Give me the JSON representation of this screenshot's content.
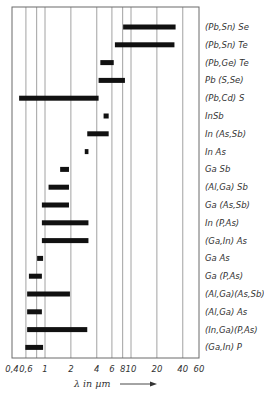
{
  "chart_data": {
    "type": "bar",
    "orientation": "horizontal-range",
    "title": "",
    "xlabel": "λ in µm",
    "xscale": "log",
    "xlim": [
      0.4,
      60
    ],
    "xticks": [
      0.4,
      0.6,
      1,
      2,
      4,
      6,
      8,
      10,
      20,
      40,
      60
    ],
    "xtick_labels": [
      "0,4",
      "0,6",
      "1",
      "2",
      "4",
      "6",
      "8",
      "10",
      "20",
      "40",
      "60"
    ],
    "gridlines": [
      0.6,
      0.8,
      1,
      2,
      4,
      6,
      8,
      10,
      20,
      40
    ],
    "grid": true,
    "legend": "none; category labels on right side",
    "categories": [
      "(Pb,Sn) Se",
      "(Pb,Sn) Te",
      "(Pb,Ge) Te",
      "Pb (S,Se)",
      "(Pb,Cd) S",
      "InSb",
      "In (As,Sb)",
      "In As",
      "Ga Sb",
      "(Al,Ga) Sb",
      "Ga (As,Sb)",
      "In (P,As)",
      "(Ga,In) As",
      "Ga As",
      "Ga (P,As)",
      "(Al,Ga)(As,Sb)",
      "(Al,Ga) As",
      "(In,Ga)(P,As)",
      "(Ga,In) P"
    ],
    "ranges": [
      [
        8.1,
        33
      ],
      [
        6.5,
        32
      ],
      [
        4.4,
        6.3
      ],
      [
        4.2,
        8.5
      ],
      [
        0.5,
        4.2
      ],
      [
        4.8,
        5.5
      ],
      [
        3.1,
        5.5
      ],
      [
        2.9,
        3.2
      ],
      [
        1.5,
        1.9
      ],
      [
        1.1,
        1.9
      ],
      [
        0.92,
        1.9
      ],
      [
        0.92,
        3.2
      ],
      [
        0.92,
        3.2
      ],
      [
        0.81,
        0.95
      ],
      [
        0.65,
        0.92
      ],
      [
        0.62,
        1.95
      ],
      [
        0.62,
        0.92
      ],
      [
        0.62,
        3.1
      ],
      [
        0.59,
        0.95
      ]
    ],
    "units": "µm"
  },
  "axis": {
    "xlabel_text": "λ in µm",
    "arrow": "→"
  }
}
